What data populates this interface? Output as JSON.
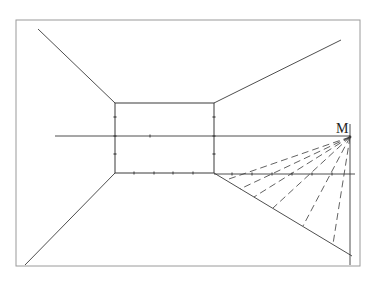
{
  "diagram": {
    "type": "one-point perspective construction",
    "canvas": {
      "width": 375,
      "height": 291,
      "background": "#ffffff"
    },
    "colors": {
      "line": "#3a3a3a",
      "frame": "#9a9a9a",
      "label": "#222222"
    },
    "frame": {
      "x": 16,
      "y": 20,
      "width": 344,
      "height": 246
    },
    "back_wall": {
      "x1": 115,
      "y1": 103,
      "x2": 214,
      "y2": 173
    },
    "ceiling_lines": [
      {
        "x1": 38,
        "y1": 29,
        "x2": 115,
        "y2": 103
      },
      {
        "x1": 341,
        "y1": 40,
        "x2": 214,
        "y2": 103
      }
    ],
    "floor_lines": [
      {
        "x1": 25,
        "y1": 265,
        "x2": 115,
        "y2": 173
      },
      {
        "x1": 214,
        "y1": 173,
        "x2": 352,
        "y2": 256
      }
    ],
    "horizon_line": {
      "x1": 55,
      "y1": 136,
      "x2": 350,
      "y2": 136
    },
    "measuring_line": {
      "x1": 214,
      "y1": 174,
      "x2": 355,
      "y2": 174
    },
    "vertical_line": {
      "x1": 350,
      "y1": 124,
      "x2": 350,
      "y2": 265
    },
    "point_M": {
      "label": "M",
      "x": 350,
      "y": 137,
      "label_x": 336,
      "label_y": 133
    },
    "dashed_rays": [
      {
        "x2": 226,
        "y2": 180
      },
      {
        "x2": 240,
        "y2": 189
      },
      {
        "x2": 254,
        "y2": 197
      },
      {
        "x2": 273,
        "y2": 208
      },
      {
        "x2": 303,
        "y2": 226
      },
      {
        "x2": 333,
        "y2": 244
      }
    ],
    "ticks": {
      "back_wall_left": [
        {
          "x": 115,
          "y": 117
        },
        {
          "x": 115,
          "y": 136
        },
        {
          "x": 115,
          "y": 154
        }
      ],
      "back_wall_right": [
        {
          "x": 214,
          "y": 117
        },
        {
          "x": 214,
          "y": 136
        },
        {
          "x": 214,
          "y": 154
        }
      ],
      "horizon": [
        {
          "x": 150,
          "y": 136
        }
      ],
      "floor_edge": [
        {
          "x": 134,
          "y": 173
        },
        {
          "x": 154,
          "y": 173
        },
        {
          "x": 173,
          "y": 173
        },
        {
          "x": 193,
          "y": 173
        }
      ],
      "measuring_line": [
        {
          "x": 232,
          "y": 174
        },
        {
          "x": 252,
          "y": 174
        },
        {
          "x": 272,
          "y": 174
        },
        {
          "x": 292,
          "y": 174
        },
        {
          "x": 312,
          "y": 174
        },
        {
          "x": 332,
          "y": 174
        }
      ]
    }
  }
}
